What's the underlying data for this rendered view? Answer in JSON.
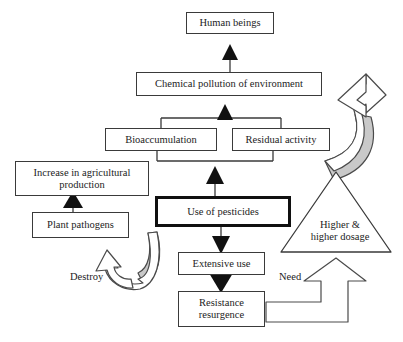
{
  "diagram": {
    "type": "flowchart",
    "colors": {
      "box_stroke": "#3a3a3a",
      "emphasis_stroke": "#101010",
      "arrowhead_fill": "#111111",
      "swoosh_shade": "#c9c9c9",
      "background": "#ffffff",
      "text": "#1c1c1c"
    },
    "nodes": {
      "human_beings": "Human beings",
      "chemical_pollution": "Chemical pollution of environment",
      "bioaccumulation": "Bioaccumulation",
      "residual_activity": "Residual activity",
      "increase_agricultural": "Increase in agricultural\nproduction",
      "plant_pathogens": "Plant pathogens",
      "use_of_pesticides": "Use of pesticides",
      "extensive_use": "Extensive use",
      "resistance_resurgence": "Resistance\nresurgence",
      "higher_dosage": "Higher &\nhigher dosage"
    },
    "edge_labels": {
      "destroy": "Destroy",
      "need": "Need"
    },
    "edges": [
      {
        "from": "chemical_pollution",
        "to": "human_beings",
        "style": "solid-triangle"
      },
      {
        "from": "bioaccumulation",
        "to": "chemical_pollution",
        "style": "solid-triangle"
      },
      {
        "from": "residual_activity",
        "to": "chemical_pollution",
        "style": "solid-triangle"
      },
      {
        "from": "use_of_pesticides",
        "to": "bioaccumulation",
        "style": "bracket-solid-triangle"
      },
      {
        "from": "use_of_pesticides",
        "to": "residual_activity",
        "style": "bracket-solid-triangle"
      },
      {
        "from": "plant_pathogens",
        "to": "increase_agricultural",
        "style": "solid-triangle"
      },
      {
        "from": "use_of_pesticides",
        "to": "extensive_use",
        "style": "solid-triangle"
      },
      {
        "from": "extensive_use",
        "to": "resistance_resurgence",
        "style": "solid-triangle"
      },
      {
        "from": "use_of_pesticides",
        "to": "plant_pathogens",
        "label": "Destroy",
        "style": "curved-swoosh"
      },
      {
        "from": "resistance_resurgence",
        "to": "higher_dosage",
        "label": "Need",
        "style": "bent-block-arrow"
      },
      {
        "from": "higher_dosage",
        "to": "use_of_pesticides",
        "style": "curved-swoosh"
      }
    ]
  }
}
